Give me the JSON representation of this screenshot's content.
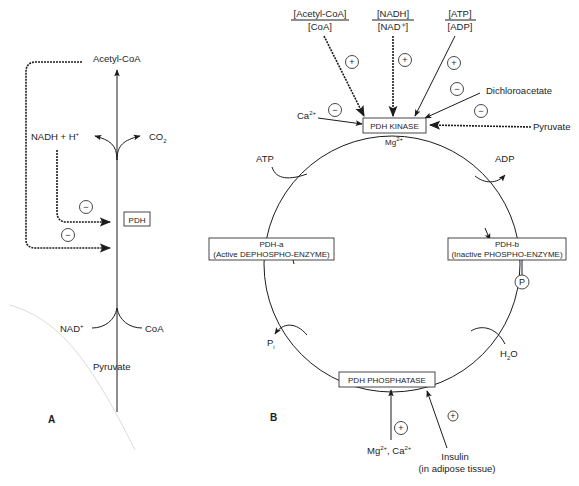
{
  "panel_a": {
    "label": "A",
    "enzyme": "PDH",
    "product_acetyl": "Acetyl-CoA",
    "product_nadh": "NADH  +  H",
    "product_nadh_sup": "+",
    "product_co2": "CO",
    "product_co2_sub": "2",
    "substrate_nad": "NAD",
    "substrate_nad_sup": "+",
    "substrate_coa": "CoA",
    "substrate_pyruvate": "Pyruvate",
    "inhibition_sign_1": "−",
    "inhibition_sign_2": "−"
  },
  "panel_b": {
    "label": "B",
    "ratio_acetyl_num": "[Acetyl-CoA]",
    "ratio_acetyl_den": "[CoA]",
    "ratio_nadh_num": "[NADH]",
    "ratio_nadh_den": "[NAD⁺]",
    "ratio_atp_num": "[ATP]",
    "ratio_atp_den": "[ADP]",
    "sign_acetyl": "+",
    "sign_nadh": "+",
    "sign_atp": "+",
    "sign_dichloro": "−",
    "sign_pyruvate": "−",
    "sign_ca": "−",
    "dichloroacetate": "Dichloroacetate",
    "pyruvate": "Pyruvate",
    "ca": "Ca",
    "ca_sup": "2+",
    "kinase": "PDH  KINASE",
    "mg": "Mg",
    "mg_sup": "2+",
    "atp": "ATP",
    "adp": "ADP",
    "pdh_a_title": "PDH-a",
    "pdh_a_sub": "(Active DEPHOSPHO-ENZYME)",
    "pdh_b_title": "PDH-b",
    "pdh_b_sub": "(Inactive PHOSPHO-ENZYME)",
    "phosphate": "P",
    "pi": "P",
    "pi_sub": "i",
    "h2o": "H",
    "h2o_sub": "2",
    "h2o_o": "O",
    "phosphatase": "PDH  PHOSPHATASE",
    "sign_mgca": "+",
    "sign_insulin": "+",
    "mgca_mg": "Mg",
    "mgca_mg_sup": "2+",
    "mgca_ca": ", Ca",
    "mgca_ca_sup": "2+",
    "insulin": "Insulin",
    "insulin_note": "(in adipose tissue)"
  }
}
